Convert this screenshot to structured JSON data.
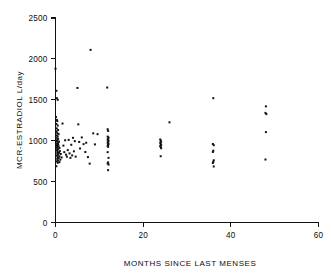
{
  "chart_data": {
    "type": "scatter",
    "title": "",
    "xlabel": "MONTHS SINCE LAST MENSES",
    "ylabel": "MCR-ESTRADIOL  L/day",
    "xlim": [
      0,
      60
    ],
    "ylim": [
      0,
      2500
    ],
    "xticks": [
      0,
      20,
      40,
      60
    ],
    "xtick_labels": [
      "0",
      "20",
      "40",
      "60"
    ],
    "yticks": [
      0,
      500,
      1000,
      1500,
      2000,
      2500
    ],
    "ytick_labels": [
      "0",
      "500",
      "1000",
      "1500",
      "2000",
      "2500"
    ],
    "grid": false,
    "legend": false,
    "marker": "square",
    "marker_color": "#111111",
    "marker_size": 2,
    "series": [
      {
        "name": "MCR-Estradiol vs months since last menses",
        "points": [
          [
            0.0,
            1880
          ],
          [
            0.2,
            1610
          ],
          [
            0.3,
            1520
          ],
          [
            0.5,
            1500
          ],
          [
            0.1,
            1290
          ],
          [
            0.3,
            1255
          ],
          [
            0.4,
            1240
          ],
          [
            0.2,
            1205
          ],
          [
            0.5,
            1185
          ],
          [
            0.3,
            1150
          ],
          [
            0.6,
            1130
          ],
          [
            0.2,
            1115
          ],
          [
            0.4,
            1095
          ],
          [
            0.7,
            1080
          ],
          [
            0.3,
            1065
          ],
          [
            0.5,
            1050
          ],
          [
            0.2,
            1035
          ],
          [
            0.6,
            1020
          ],
          [
            0.4,
            1008
          ],
          [
            0.3,
            995
          ],
          [
            0.8,
            988
          ],
          [
            0.5,
            975
          ],
          [
            0.2,
            965
          ],
          [
            0.6,
            958
          ],
          [
            0.4,
            948
          ],
          [
            0.3,
            940
          ],
          [
            0.7,
            932
          ],
          [
            0.5,
            925
          ],
          [
            0.2,
            918
          ],
          [
            0.9,
            910
          ],
          [
            0.4,
            900
          ],
          [
            0.6,
            892
          ],
          [
            0.3,
            880
          ],
          [
            1.0,
            872
          ],
          [
            0.5,
            862
          ],
          [
            0.8,
            852
          ],
          [
            0.4,
            845
          ],
          [
            1.2,
            838
          ],
          [
            0.6,
            828
          ],
          [
            0.3,
            818
          ],
          [
            0.9,
            808
          ],
          [
            0.5,
            800
          ],
          [
            1.4,
            795
          ],
          [
            0.7,
            788
          ],
          [
            0.4,
            778
          ],
          [
            1.1,
            768
          ],
          [
            0.6,
            758
          ],
          [
            0.3,
            748
          ],
          [
            0.9,
            738
          ],
          [
            0.5,
            730
          ],
          [
            0.2,
            688
          ],
          [
            1.6,
            1210
          ],
          [
            1.8,
            940
          ],
          [
            2.0,
            860
          ],
          [
            2.2,
            1005
          ],
          [
            2.4,
            830
          ],
          [
            2.6,
            805
          ],
          [
            2.8,
            885
          ],
          [
            3.0,
            1010
          ],
          [
            3.2,
            845
          ],
          [
            3.4,
            790
          ],
          [
            3.6,
            950
          ],
          [
            3.8,
            820
          ],
          [
            4.0,
            1035
          ],
          [
            4.2,
            870
          ],
          [
            4.4,
            995
          ],
          [
            4.6,
            805
          ],
          [
            5.0,
            1645
          ],
          [
            5.2,
            1200
          ],
          [
            5.4,
            985
          ],
          [
            5.6,
            905
          ],
          [
            6.0,
            1040
          ],
          [
            6.4,
            958
          ],
          [
            6.8,
            862
          ],
          [
            7.0,
            975
          ],
          [
            7.4,
            800
          ],
          [
            7.8,
            720
          ],
          [
            8.0,
            2110
          ],
          [
            8.6,
            1090
          ],
          [
            9.0,
            955
          ],
          [
            9.6,
            1080
          ],
          [
            11.8,
            1650
          ],
          [
            11.9,
            1140
          ],
          [
            12.0,
            1120
          ],
          [
            11.9,
            1050
          ],
          [
            12.1,
            1038
          ],
          [
            12.0,
            1025
          ],
          [
            11.9,
            1012
          ],
          [
            12.1,
            1000
          ],
          [
            12.0,
            988
          ],
          [
            11.9,
            975
          ],
          [
            12.1,
            962
          ],
          [
            12.0,
            950
          ],
          [
            11.9,
            938
          ],
          [
            12.0,
            925
          ],
          [
            11.9,
            860
          ],
          [
            12.1,
            790
          ],
          [
            12.0,
            735
          ],
          [
            11.9,
            722
          ],
          [
            12.1,
            708
          ],
          [
            12.0,
            640
          ],
          [
            23.9,
            1015
          ],
          [
            24.0,
            1000
          ],
          [
            24.1,
            988
          ],
          [
            23.9,
            975
          ],
          [
            24.0,
            960
          ],
          [
            24.1,
            948
          ],
          [
            23.9,
            935
          ],
          [
            24.0,
            922
          ],
          [
            24.1,
            908
          ],
          [
            24.0,
            810
          ],
          [
            26.0,
            1225
          ],
          [
            36.0,
            1520
          ],
          [
            35.9,
            960
          ],
          [
            36.1,
            945
          ],
          [
            36.0,
            878
          ],
          [
            35.9,
            862
          ],
          [
            36.1,
            760
          ],
          [
            36.0,
            742
          ],
          [
            35.9,
            728
          ],
          [
            36.1,
            685
          ],
          [
            48.0,
            1420
          ],
          [
            47.9,
            1340
          ],
          [
            48.1,
            1325
          ],
          [
            48.0,
            1105
          ],
          [
            47.9,
            770
          ]
        ]
      }
    ]
  },
  "axes": {
    "x_title": "MONTHS SINCE LAST MENSES",
    "y_title": "MCR-ESTRADIOL  L/day"
  }
}
